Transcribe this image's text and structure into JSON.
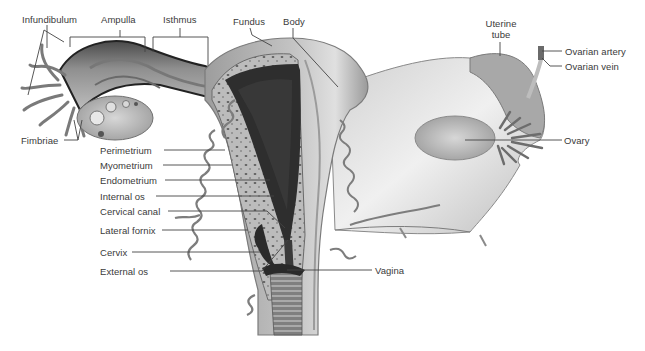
{
  "diagram": {
    "colors": {
      "background": "#ffffff",
      "label_text": "#3a3a3a",
      "leader_line": "#444444",
      "tissue_light": "#c9c9c9",
      "tissue_mid": "#9a9a9a",
      "cavity_dark": "#2a2a2a",
      "ligament": "#dedede"
    },
    "labels": {
      "infundibulum": "Infundibulum",
      "ampulla": "Ampulla",
      "isthmus": "Isthmus",
      "fundus": "Fundus",
      "body": "Body",
      "uterine_tube_line1": "Uterine",
      "uterine_tube_line2": "tube",
      "ovarian_artery": "Ovarian artery",
      "ovarian_vein": "Ovarian vein",
      "fimbriae": "Fimbriae",
      "ovary": "Ovary",
      "perimetrium": "Perimetrium",
      "myometrium": "Myometrium",
      "endometrium": "Endometrium",
      "internal_os": "Internal os",
      "cervical_canal": "Cervical canal",
      "lateral_fornix": "Lateral fornix",
      "cervix": "Cervix",
      "external_os": "External os",
      "vagina": "Vagina"
    }
  }
}
